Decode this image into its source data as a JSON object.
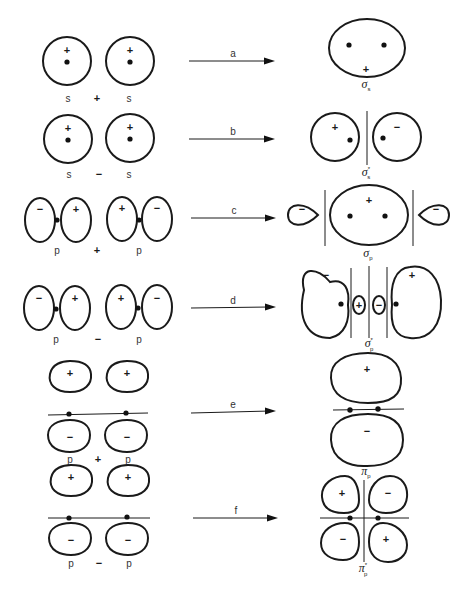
{
  "diagram": {
    "rows": [
      {
        "id": "a",
        "arrow_label": "a",
        "left_label": "s",
        "operator": "+",
        "right_label": "s",
        "left_orbital_signs": [
          "+"
        ],
        "right_orbital_signs": [
          "+"
        ],
        "result": {
          "symbol": "σ",
          "subscript": "s",
          "superscript": "",
          "signs": [
            "+"
          ]
        }
      },
      {
        "id": "b",
        "arrow_label": "b",
        "left_label": "s",
        "operator": "−",
        "right_label": "s",
        "left_orbital_signs": [
          "+"
        ],
        "right_orbital_signs": [
          "+"
        ],
        "result": {
          "symbol": "σ",
          "subscript": "s",
          "superscript": "*",
          "signs": [
            "+",
            "−"
          ]
        }
      },
      {
        "id": "c",
        "arrow_label": "c",
        "left_label": "p",
        "operator": "+",
        "right_label": "p",
        "left_orbital_signs": [
          "−",
          "+"
        ],
        "right_orbital_signs": [
          "+",
          "−"
        ],
        "result": {
          "symbol": "σ",
          "subscript": "p",
          "superscript": "",
          "signs": [
            "−",
            "+",
            "−"
          ]
        }
      },
      {
        "id": "d",
        "arrow_label": "d",
        "left_label": "p",
        "operator": "−",
        "right_label": "p",
        "left_orbital_signs": [
          "−",
          "+"
        ],
        "right_orbital_signs": [
          "+",
          "−"
        ],
        "result": {
          "symbol": "σ",
          "subscript": "p",
          "superscript": "*",
          "signs": [
            "−",
            "+",
            "−",
            "+"
          ]
        }
      },
      {
        "id": "e",
        "arrow_label": "e",
        "left_label": "p",
        "operator": "+",
        "right_label": "p",
        "left_orbital_signs": [
          "+",
          "−"
        ],
        "right_orbital_signs": [
          "+",
          "−"
        ],
        "result": {
          "symbol": "π",
          "subscript": "p",
          "superscript": "",
          "signs": [
            "+",
            "−"
          ]
        }
      },
      {
        "id": "f",
        "arrow_label": "f",
        "left_label": "p",
        "operator": "−",
        "right_label": "p",
        "left_orbital_signs": [
          "+",
          "−"
        ],
        "right_orbital_signs": [
          "+",
          "−"
        ],
        "result": {
          "symbol": "π",
          "subscript": "p",
          "superscript": "*",
          "signs": [
            "+",
            "−",
            "−",
            "+"
          ]
        }
      }
    ]
  },
  "colors": {
    "line": "#1a1a1a",
    "background": "#ffffff"
  }
}
